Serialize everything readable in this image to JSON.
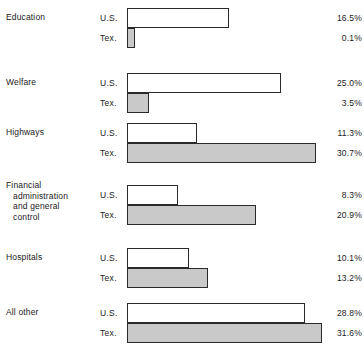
{
  "chart_data": {
    "type": "bar",
    "title": "",
    "subtitle": "",
    "xlabel": "",
    "ylabel": "",
    "orientation": "horizontal",
    "grid": false,
    "legend": "none",
    "value_suffix": "%",
    "xlim": [
      0,
      31.6
    ],
    "categories": [
      "Education",
      "Welfare",
      "Highways",
      "Financial administration and general control",
      "Hospitals",
      "All other"
    ],
    "series": [
      {
        "name": "U.S.",
        "values": [
          16.5,
          25.0,
          11.3,
          8.3,
          10.1,
          28.8
        ]
      },
      {
        "name": "Tex.",
        "values": [
          0.1,
          3.5,
          30.7,
          20.9,
          13.2,
          31.6
        ]
      }
    ],
    "rows": [
      {
        "category_lines": [
          "Education"
        ],
        "bars": [
          {
            "series": "U.S.",
            "label": "U.S.",
            "value": 16.5,
            "value_text": "16.5%",
            "style": "us"
          },
          {
            "series": "Tex.",
            "label": "Tex.",
            "value": 0.1,
            "value_text": "0.1%",
            "style": "tex"
          }
        ]
      },
      {
        "category_lines": [
          "Welfare"
        ],
        "bars": [
          {
            "series": "U.S.",
            "label": "U.S.",
            "value": 25.0,
            "value_text": "25.0%",
            "style": "us"
          },
          {
            "series": "Tex.",
            "label": "Tex.",
            "value": 3.5,
            "value_text": "3.5%",
            "style": "tex"
          }
        ]
      },
      {
        "category_lines": [
          "Highways"
        ],
        "bars": [
          {
            "series": "U.S.",
            "label": "U.S.",
            "value": 11.3,
            "value_text": "11.3%",
            "style": "us"
          },
          {
            "series": "Tex.",
            "label": "Tex.",
            "value": 30.7,
            "value_text": "30.7%",
            "style": "tex"
          }
        ]
      },
      {
        "category_lines": [
          "Financial",
          "administration",
          "and general",
          "control"
        ],
        "bars": [
          {
            "series": "U.S.",
            "label": "U.S.",
            "value": 8.3,
            "value_text": "8.3%",
            "style": "us"
          },
          {
            "series": "Tex.",
            "label": "Tex.",
            "value": 20.9,
            "value_text": "20.9%",
            "style": "tex"
          }
        ]
      },
      {
        "category_lines": [
          "Hospitals"
        ],
        "bars": [
          {
            "series": "U.S.",
            "label": "U.S.",
            "value": 10.1,
            "value_text": "10.1%",
            "style": "us"
          },
          {
            "series": "Tex.",
            "label": "Tex.",
            "value": 13.2,
            "value_text": "13.2%",
            "style": "tex"
          }
        ]
      },
      {
        "category_lines": [
          "All other"
        ],
        "bars": [
          {
            "series": "U.S.",
            "label": "U.S.",
            "value": 28.8,
            "value_text": "28.8%",
            "style": "us"
          },
          {
            "series": "Tex.",
            "label": "Tex.",
            "value": 31.6,
            "value_text": "31.6%",
            "style": "tex"
          }
        ]
      }
    ]
  },
  "layout": {
    "bar_origin_x": 127,
    "px_per_unit": 6.17,
    "min_bar_px": 8,
    "bar_height": 20,
    "group_tops": [
      8,
      73,
      123,
      185,
      248,
      303
    ],
    "label_tops": [
      12,
      77,
      127,
      180,
      252,
      307
    ]
  }
}
